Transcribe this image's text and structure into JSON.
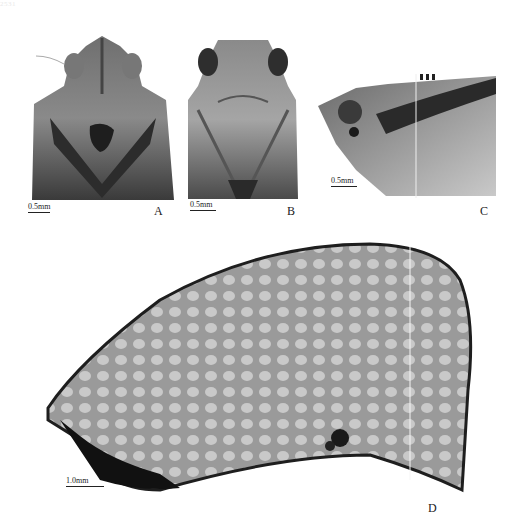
{
  "figure": {
    "cropped_header_text": "2531",
    "panels": [
      {
        "id": "A",
        "label": "A",
        "scale_bar": "0.5mm",
        "view": "head and pronotum, dorsal view"
      },
      {
        "id": "B",
        "label": "B",
        "scale_bar": "0.5mm",
        "view": "head, ventral/frontal view"
      },
      {
        "id": "C",
        "label": "C",
        "scale_bar": "0.5mm",
        "view": "head and thorax, lateral view"
      },
      {
        "id": "D",
        "label": "D",
        "scale_bar": "1.0mm",
        "view": "tegmen (forewing) with reticulate venation"
      }
    ]
  }
}
